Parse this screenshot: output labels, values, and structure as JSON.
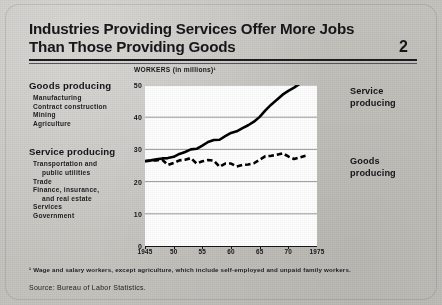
{
  "header": {
    "title_line1": "Industries Providing Services Offer More Jobs",
    "title_line2": "Than Those Providing Goods",
    "page_number": "2"
  },
  "legend": {
    "goods": {
      "heading": "Goods producing",
      "items": [
        "Manufacturing",
        "Contract construction",
        "Mining",
        "Agriculture"
      ]
    },
    "service": {
      "heading": "Service producing",
      "items": [
        "Transportation and",
        "public utilities",
        "Trade",
        "Finance, insurance,",
        "and real estate",
        "Services",
        "Government"
      ]
    }
  },
  "annotations": {
    "service_label": "Service\nproducing",
    "service_label_line1": "Service",
    "service_label_line2": "producing",
    "goods_label_line1": "Goods",
    "goods_label_line2": "producing"
  },
  "footnotes": {
    "footnote1": "¹ Wage and salary workers, except agriculture, which include self-employed and unpaid family workers.",
    "source": "Source:  Bureau of Labor Statistics."
  },
  "colors": {
    "paper": "#c6c4bf",
    "ink": "#17171a",
    "plot_background": "#ffffff",
    "gridline": "#8e8e93",
    "series_line": "#000000"
  },
  "chart_data": {
    "type": "line",
    "title": "WORKERS",
    "subtitle": "(in millions)¹",
    "xlabel": "",
    "ylabel": "WORKERS (in millions)",
    "xlim": [
      1945,
      1975
    ],
    "ylim": [
      0,
      50
    ],
    "yticks": [
      0,
      10,
      20,
      30,
      40,
      50
    ],
    "ytick_labels": [
      "0",
      "10",
      "20",
      "30",
      "40",
      "50"
    ],
    "xticks": [
      1945,
      1950,
      1955,
      1960,
      1965,
      1970,
      1975
    ],
    "xtick_labels": [
      "1945",
      "50",
      "55",
      "60",
      "65",
      "70",
      "1975"
    ],
    "grid": "horizontal",
    "legend_position": "right-annotations",
    "x": [
      1945,
      1946,
      1947,
      1948,
      1949,
      1950,
      1951,
      1952,
      1953,
      1954,
      1955,
      1956,
      1957,
      1958,
      1959,
      1960,
      1961,
      1962,
      1963,
      1964,
      1965,
      1966,
      1967,
      1968,
      1969,
      1970,
      1971,
      1972,
      1973
    ],
    "series": [
      {
        "name": "Service producing",
        "style": "solid",
        "values": [
          26.4,
          26.6,
          26.9,
          27.2,
          27.3,
          27.7,
          28.6,
          29.2,
          30.0,
          30.2,
          31.2,
          32.3,
          32.9,
          33.0,
          34.1,
          35.1,
          35.6,
          36.6,
          37.5,
          38.6,
          40.1,
          42.1,
          43.9,
          45.4,
          47.0,
          48.2,
          49.2,
          50.4,
          51.5
        ]
      },
      {
        "name": "Goods producing",
        "style": "dashed",
        "values": [
          26.3,
          26.5,
          26.6,
          26.8,
          25.2,
          25.8,
          26.6,
          26.8,
          27.3,
          25.6,
          26.3,
          26.7,
          26.5,
          24.6,
          25.6,
          25.6,
          24.7,
          25.2,
          25.3,
          25.7,
          26.8,
          27.9,
          28.0,
          28.3,
          28.8,
          27.8,
          27.0,
          27.5,
          28.0
        ]
      }
    ]
  }
}
